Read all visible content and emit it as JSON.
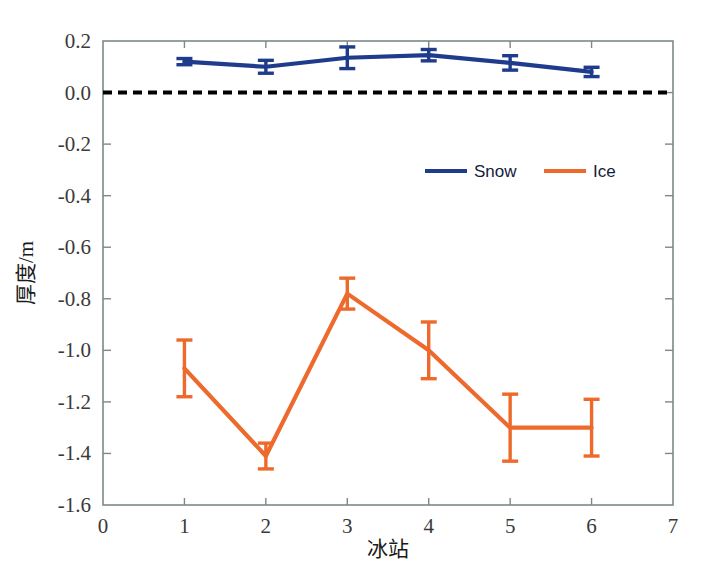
{
  "chart_data": {
    "type": "line",
    "title": "",
    "xlabel": "冰站",
    "ylabel": "厚度/m",
    "xlim": [
      0,
      7
    ],
    "ylim": [
      -1.6,
      0.2
    ],
    "grid": false,
    "legend_position": "inside-center-right",
    "x_ticks": [
      "0",
      "1",
      "2",
      "3",
      "4",
      "5",
      "6",
      "7"
    ],
    "x_tick_values": [
      0,
      1,
      2,
      3,
      4,
      5,
      6,
      7
    ],
    "y_ticks": [
      "0.2",
      "0.0",
      "-0.2",
      "-0.4",
      "-0.6",
      "-0.8",
      "-1.0",
      "-1.2",
      "-1.4",
      "-1.6"
    ],
    "y_tick_values": [
      0.2,
      0.0,
      -0.2,
      -0.4,
      -0.6,
      -0.8,
      -1.0,
      -1.2,
      -1.4,
      -1.6
    ],
    "x": [
      1,
      2,
      3,
      4,
      5,
      6
    ],
    "annotations": [
      {
        "name": "zero-reference-line",
        "type": "hline",
        "y": 0.0,
        "style": "dashed",
        "color": "#000000"
      }
    ],
    "series": [
      {
        "name": "Snow",
        "color": "#1F3B8C",
        "values": [
          0.12,
          0.1,
          0.135,
          0.145,
          0.115,
          0.08
        ],
        "errors": [
          0.012,
          0.025,
          0.042,
          0.022,
          0.028,
          0.018
        ]
      },
      {
        "name": "Ice",
        "color": "#ED6A2C",
        "values": [
          -1.07,
          -1.41,
          -0.78,
          -1.0,
          -1.3,
          -1.3
        ],
        "errors": [
          0.11,
          0.05,
          0.06,
          0.11,
          0.13,
          0.11
        ]
      }
    ]
  },
  "legend": {
    "items": [
      {
        "label": "Snow",
        "color": "#1F3B8C"
      },
      {
        "label": "Ice",
        "color": "#ED6A2C"
      }
    ]
  },
  "axes": {
    "x_axis_label": "冰站",
    "y_axis_label": "厚度/m"
  }
}
